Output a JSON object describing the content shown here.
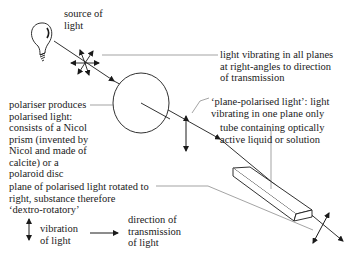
{
  "labels": {
    "source": "source of\nlight",
    "all_planes": "light vibrating in all planes\nat right-angles to direction\nof transmission",
    "polariser": "polariser produces\npolarised light:\nconsists of a Nicol\nprism (invented by\nNicol and made of\ncalcite) or a\npolaroid disc",
    "plane_polarised": "‘plane-polarised light’: light\nvibrating in one plane only",
    "tube": "tube containing optically\nactive liquid or solution",
    "rotated": "plane of polarised light rotated to\nright, substance therefore\n‘dextro-rotatory’",
    "legend_vibration": "vibration\nof light",
    "legend_direction": "direction of\ntransmission\nof light"
  },
  "icons": [
    "light-bulb-icon",
    "multi-direction-arrows-icon",
    "polariser-disc",
    "vertical-double-arrow-icon",
    "tube-prism",
    "tilted-double-arrow-icon",
    "right-arrow-icon"
  ],
  "colors": {
    "ink": "#1a1a1a",
    "leader": "#555555",
    "background": "#ffffff"
  }
}
